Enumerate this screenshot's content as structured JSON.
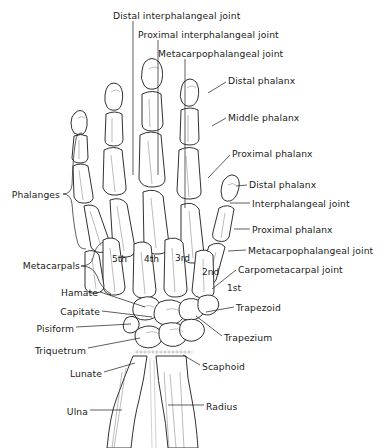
{
  "figure": {
    "background_color": "#ffffff",
    "ink_color": "#1a1a1a",
    "width": 392,
    "height": 448
  },
  "labels": {
    "top": [
      {
        "id": "distal-interphalangeal-joint",
        "text": "Distal interphalangeal joint",
        "x": 113,
        "y": 10,
        "align": "left",
        "leader": {
          "type": "vertical",
          "x": 133,
          "y1": 21,
          "y2": 175
        }
      },
      {
        "id": "proximal-interphalangeal-joint",
        "text": "Proximal interphalangeal joint",
        "x": 138,
        "y": 29,
        "align": "left",
        "leader": {
          "type": "vertical",
          "x": 158,
          "y1": 40,
          "y2": 175
        }
      },
      {
        "id": "metacarpophalangeal-joint",
        "text": "Metacarpophalangeal joint",
        "x": 158,
        "y": 48,
        "align": "left",
        "leader": {
          "type": "vertical",
          "x": 185,
          "y1": 59,
          "y2": 208
        }
      }
    ],
    "right": [
      {
        "id": "distal-phalanx-3rd",
        "text": "Distal phalanx",
        "x": 228,
        "y": 75,
        "leader": {
          "x1": 226,
          "y1": 82,
          "x2": 208,
          "y2": 93
        }
      },
      {
        "id": "middle-phalanx-3rd",
        "text": "Middle phalanx",
        "x": 228,
        "y": 112,
        "leader": {
          "x1": 226,
          "y1": 118,
          "x2": 212,
          "y2": 126
        }
      },
      {
        "id": "proximal-phalanx-3rd",
        "text": "Proximal phalanx",
        "x": 232,
        "y": 148,
        "leader": {
          "x1": 230,
          "y1": 155,
          "x2": 208,
          "y2": 178
        }
      },
      {
        "id": "distal-phalanx-thumb",
        "text": "Distal phalanx",
        "x": 249,
        "y": 179,
        "leader": {
          "x1": 247,
          "y1": 185,
          "x2": 238,
          "y2": 186
        }
      },
      {
        "id": "interphalangeal-joint",
        "text": "Interphalangeal joint",
        "x": 252,
        "y": 198,
        "leader": {
          "x1": 250,
          "y1": 203,
          "x2": 232,
          "y2": 203
        }
      },
      {
        "id": "proximal-phalanx-thumb",
        "text": "Proximal phalanx",
        "x": 252,
        "y": 224,
        "leader": {
          "x1": 250,
          "y1": 229,
          "x2": 236,
          "y2": 229
        }
      },
      {
        "id": "metacarpophalangeal-joint-thumb",
        "text": "Metacarpophalangeal joint",
        "x": 248,
        "y": 245,
        "leader": {
          "x1": 246,
          "y1": 250,
          "x2": 230,
          "y2": 251
        }
      },
      {
        "id": "carpometacarpal-joint",
        "text": "Carpometacarpal joint",
        "x": 238,
        "y": 264,
        "leader": {
          "x1": 236,
          "y1": 270,
          "x2": 214,
          "y2": 288
        }
      },
      {
        "id": "trapezoid",
        "text": "Trapezoid",
        "x": 236,
        "y": 302,
        "leader": {
          "x1": 234,
          "y1": 307,
          "x2": 208,
          "y2": 312
        }
      },
      {
        "id": "trapezium",
        "text": "Trapezium",
        "x": 224,
        "y": 332,
        "leader": {
          "x1": 222,
          "y1": 336,
          "x2": 196,
          "y2": 315
        }
      },
      {
        "id": "scaphoid",
        "text": "Scaphoid",
        "x": 202,
        "y": 361,
        "leader": {
          "x1": 200,
          "y1": 365,
          "x2": 183,
          "y2": 355
        }
      },
      {
        "id": "radius",
        "text": "Radius",
        "x": 206,
        "y": 401,
        "leader": {
          "x1": 204,
          "y1": 405,
          "x2": 168,
          "y2": 405
        }
      }
    ],
    "left": [
      {
        "id": "phalanges",
        "text": "Phalanges",
        "x": 18,
        "y": 189,
        "brace": {
          "x": 72,
          "y_top": 133,
          "y_bottom": 243,
          "tip_x": 63,
          "tip_y": 194
        }
      },
      {
        "id": "metacarpals",
        "text": "Metacarpals",
        "x": 22,
        "y": 260,
        "brace": {
          "x": 107,
          "y_top": 240,
          "y_bottom": 300,
          "tip_x": 81,
          "tip_y": 266
        }
      },
      {
        "id": "hamate",
        "text": "Hamate",
        "x": 58,
        "y": 287,
        "leader": {
          "x1": 100,
          "y1": 292,
          "x2": 145,
          "y2": 307
        }
      },
      {
        "id": "capitate",
        "text": "Capitate",
        "x": 58,
        "y": 306,
        "leader": {
          "x1": 102,
          "y1": 311,
          "x2": 152,
          "y2": 316
        }
      },
      {
        "id": "pisiform",
        "text": "Pisiform",
        "x": 34,
        "y": 323,
        "leader": {
          "x1": 76,
          "y1": 327,
          "x2": 133,
          "y2": 324
        }
      },
      {
        "id": "triquetrum",
        "text": "Triquetrum",
        "x": 34,
        "y": 345,
        "leader": {
          "x1": 88,
          "y1": 348,
          "x2": 140,
          "y2": 338
        }
      },
      {
        "id": "lunate",
        "text": "Lunate",
        "x": 68,
        "y": 368,
        "leader": {
          "x1": 104,
          "y1": 372,
          "x2": 135,
          "y2": 363
        }
      },
      {
        "id": "ulna",
        "text": "Ulna",
        "x": 68,
        "y": 406,
        "leader": {
          "x1": 90,
          "y1": 410,
          "x2": 122,
          "y2": 410
        }
      }
    ],
    "digit_numbers": [
      {
        "id": "digit-5th",
        "text": "5th",
        "x": 112,
        "y": 254
      },
      {
        "id": "digit-4th",
        "text": "4th",
        "x": 144,
        "y": 254
      },
      {
        "id": "digit-3rd",
        "text": "3rd",
        "x": 175,
        "y": 253
      },
      {
        "id": "digit-2nd",
        "text": "2nd",
        "x": 202,
        "y": 267
      },
      {
        "id": "digit-1st",
        "text": "1st",
        "x": 227,
        "y": 283
      }
    ]
  }
}
